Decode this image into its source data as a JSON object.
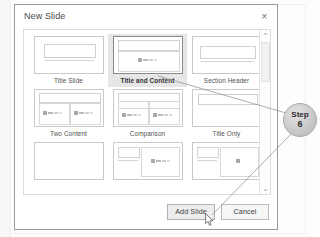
{
  "dialog": {
    "title": "New Slide",
    "close_icon": "close-x-icon"
  },
  "gallery": {
    "rows": [
      [
        {
          "label": "Title Slide",
          "selected": false,
          "kind": "title-slide"
        },
        {
          "label": "Title and Content",
          "selected": true,
          "kind": "title-and-content"
        },
        {
          "label": "Section Header",
          "selected": false,
          "kind": "section-header"
        }
      ],
      [
        {
          "label": "Two Content",
          "selected": false,
          "kind": "two-content"
        },
        {
          "label": "Comparison",
          "selected": false,
          "kind": "comparison"
        },
        {
          "label": "Title Only",
          "selected": false,
          "kind": "title-only"
        }
      ],
      [
        {
          "label": "",
          "selected": false,
          "kind": "blank"
        },
        {
          "label": "",
          "selected": false,
          "kind": "content-with-caption"
        },
        {
          "label": "",
          "selected": false,
          "kind": "picture-with-caption"
        }
      ]
    ]
  },
  "scrollbar": {
    "up_icon": "chevron-up-icon",
    "down_icon": "chevron-down-icon",
    "up_glyph": "⌃",
    "down_glyph": "⌄"
  },
  "footer": {
    "add_slide_label": "Add Slide",
    "cancel_label": "Cancel"
  },
  "callout": {
    "word": "Step",
    "number": "6"
  },
  "colors": {
    "dialog_border": "#999a9c",
    "selected_bg": "#e6e6e6",
    "thumb_border": "#c9c9c9",
    "callout_fill": "#cfcfcf",
    "leader_line": "#8b8b8b"
  }
}
